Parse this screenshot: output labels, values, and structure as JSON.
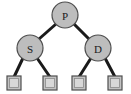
{
  "diagram": {
    "type": "binary-tree",
    "background_color": "#ffffff",
    "style": {
      "node_fill": "#bdbdbd",
      "node_stroke": "#4d4d4d",
      "node_stroke_width": 1.2,
      "leaf_fill": "#c6c6c6",
      "leaf_inner_fill": "#d4d4d4",
      "leaf_stroke": "#555555",
      "edge_color": "#1a1a1a",
      "edge_width": 3,
      "label_color": "#1a1a1a"
    },
    "nodes": [
      {
        "id": "root",
        "label": "P",
        "shape": "circle",
        "cx": 65,
        "cy": 15,
        "r": 13
      },
      {
        "id": "left",
        "label": "S",
        "shape": "circle",
        "cx": 30,
        "cy": 48,
        "r": 13
      },
      {
        "id": "right",
        "label": "D",
        "shape": "circle",
        "cx": 98,
        "cy": 48,
        "r": 13
      }
    ],
    "leaves": [
      {
        "id": "leaf-1",
        "shape": "square",
        "x": 7,
        "y": 76,
        "size": 14
      },
      {
        "id": "leaf-2",
        "shape": "square",
        "x": 43,
        "y": 76,
        "size": 14
      },
      {
        "id": "leaf-3",
        "shape": "square",
        "x": 72,
        "y": 76,
        "size": 14
      },
      {
        "id": "leaf-4",
        "shape": "square",
        "x": 108,
        "y": 76,
        "size": 14
      }
    ],
    "edges": [
      {
        "id": "edge-root-left",
        "from": "root",
        "to": "left",
        "x1": 56,
        "y1": 24,
        "x2": 39,
        "y2": 39
      },
      {
        "id": "edge-root-right",
        "from": "root",
        "to": "right",
        "x1": 74,
        "y1": 24,
        "x2": 89,
        "y2": 39
      },
      {
        "id": "edge-left-leaf1",
        "from": "left",
        "to": "leaf-1",
        "x1": 23,
        "y1": 58,
        "x2": 14,
        "y2": 76
      },
      {
        "id": "edge-left-leaf2",
        "from": "left",
        "to": "leaf-2",
        "x1": 37,
        "y1": 58,
        "x2": 50,
        "y2": 76
      },
      {
        "id": "edge-right-leaf3",
        "from": "right",
        "to": "leaf-3",
        "x1": 91,
        "y1": 58,
        "x2": 79,
        "y2": 76
      },
      {
        "id": "edge-right-leaf4",
        "from": "right",
        "to": "leaf-4",
        "x1": 105,
        "y1": 58,
        "x2": 115,
        "y2": 76
      }
    ]
  }
}
